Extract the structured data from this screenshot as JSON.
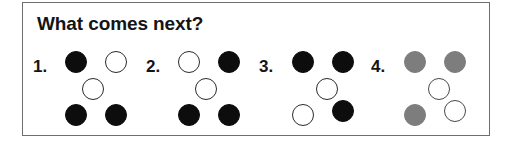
{
  "title": "What comes next?",
  "colors": {
    "filled_black": "#0d0d0d",
    "filled_gray": "#7d7d7d",
    "open_stroke": "#2b2b2b",
    "border": "#6e6e6e",
    "background": "#ffffff",
    "text": "#141414"
  },
  "puzzle": {
    "slots": [
      "top-left",
      "top-right",
      "center",
      "bottom-left",
      "bottom-right"
    ],
    "options": [
      {
        "label": "1.",
        "number": 1,
        "color_scheme": "black",
        "dots": [
          {
            "slot": "top-left",
            "state": "filled"
          },
          {
            "slot": "top-right",
            "state": "open"
          },
          {
            "slot": "center",
            "state": "open"
          },
          {
            "slot": "bottom-left",
            "state": "filled"
          },
          {
            "slot": "bottom-right",
            "state": "filled"
          }
        ]
      },
      {
        "label": "2.",
        "number": 2,
        "color_scheme": "black",
        "dots": [
          {
            "slot": "top-left",
            "state": "open"
          },
          {
            "slot": "top-right",
            "state": "filled"
          },
          {
            "slot": "center",
            "state": "open"
          },
          {
            "slot": "bottom-left",
            "state": "filled"
          },
          {
            "slot": "bottom-right",
            "state": "filled"
          }
        ]
      },
      {
        "label": "3.",
        "number": 3,
        "color_scheme": "black",
        "dots": [
          {
            "slot": "top-left",
            "state": "filled"
          },
          {
            "slot": "top-right",
            "state": "filled"
          },
          {
            "slot": "center",
            "state": "open"
          },
          {
            "slot": "bottom-left",
            "state": "open"
          },
          {
            "slot": "bottom-right",
            "state": "filled"
          }
        ]
      },
      {
        "label": "4.",
        "number": 4,
        "color_scheme": "gray",
        "dots": [
          {
            "slot": "top-left",
            "state": "filled"
          },
          {
            "slot": "top-right",
            "state": "filled"
          },
          {
            "slot": "center",
            "state": "open"
          },
          {
            "slot": "bottom-left",
            "state": "filled"
          },
          {
            "slot": "bottom-right",
            "state": "open"
          }
        ]
      }
    ]
  }
}
